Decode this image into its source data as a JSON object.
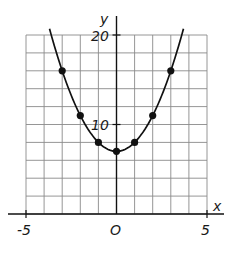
{
  "chart_data": {
    "type": "line",
    "title": "",
    "xlabel": "x",
    "ylabel": "y",
    "function": "y = x^2 + 7",
    "xlim": [
      -5,
      5
    ],
    "ylim": [
      0,
      20
    ],
    "grid": true,
    "grid_step_x": 1,
    "grid_step_y": 2,
    "x_tick_labels": [
      "-5",
      "O",
      "5"
    ],
    "x_tick_values": [
      -5,
      0,
      5
    ],
    "y_tick_labels": [
      "10",
      "20"
    ],
    "y_tick_values": [
      10,
      20
    ],
    "origin_label": "O",
    "series": [
      {
        "name": "parabola",
        "x": [
          -3,
          -2,
          -1,
          0,
          1,
          2,
          3
        ],
        "y": [
          16,
          11,
          8,
          7,
          8,
          11,
          16
        ],
        "marker": "filled-circle",
        "curve_extends_x": [
          -3.7,
          3.7
        ]
      }
    ],
    "legend": null
  },
  "colors": {
    "background": "#ffffff",
    "grid": "#8a8a8a",
    "axis": "#111111",
    "curve": "#111111",
    "points": "#111111"
  },
  "labels": {
    "x_axis": "x",
    "y_axis": "y",
    "x_min": "-5",
    "x_max": "5",
    "origin": "O",
    "y_10": "10",
    "y_20": "20"
  }
}
